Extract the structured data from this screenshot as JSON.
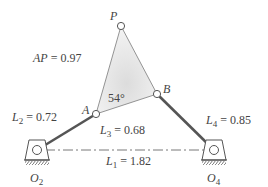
{
  "diagram": {
    "type": "four-bar linkage with coupler triangle",
    "points": {
      "P": {
        "label": "P",
        "x": 121,
        "y": 26
      },
      "A": {
        "label": "A",
        "x": 96,
        "y": 114
      },
      "B": {
        "label": "B",
        "x": 157,
        "y": 94
      },
      "O2": {
        "label": "O",
        "sub": "2",
        "x": 37,
        "y": 150
      },
      "O4": {
        "label": "O",
        "sub": "4",
        "x": 214,
        "y": 150
      }
    },
    "labels": {
      "ap": {
        "var": "AP",
        "value": "= 0.97"
      },
      "l2": {
        "var": "L",
        "sub": "2",
        "value": "= 0.72"
      },
      "l3": {
        "var": "L",
        "sub": "3",
        "value": "= 0.68"
      },
      "l4": {
        "var": "L",
        "sub": "4",
        "value": "= 0.85"
      },
      "l1": {
        "var": "L",
        "sub": "1",
        "value": "= 1.82"
      },
      "angle": "54°"
    },
    "colors": {
      "link": "#555555",
      "coupler_fill": "#e6e6e6",
      "coupler_edge": "#888888",
      "text": "#444444"
    }
  }
}
